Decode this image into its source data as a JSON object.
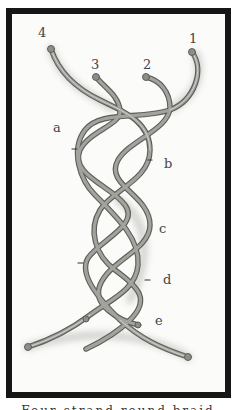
{
  "figure": {
    "title": "Four-strand round braid",
    "strand_labels": [
      "1",
      "2",
      "3",
      "4"
    ],
    "step_labels": [
      "a",
      "b",
      "c",
      "d",
      "e"
    ],
    "caption": "Four-strand round braid"
  },
  "colors": {
    "frame": "#161616",
    "background": "#fbfbfa",
    "rope": "#9a9a94",
    "rope_shadow": "#5e5e5a",
    "label": "#444444"
  }
}
